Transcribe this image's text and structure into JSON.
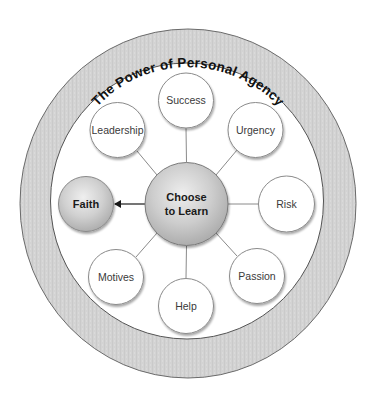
{
  "diagram": {
    "title": "The Power of Personal Agency",
    "center": {
      "line1": "Choose",
      "line2": "to Learn"
    },
    "outcome": {
      "label": "Faith"
    },
    "satellites": [
      {
        "label": "Success"
      },
      {
        "label": "Urgency"
      },
      {
        "label": "Risk"
      },
      {
        "label": "Passion"
      },
      {
        "label": "Help"
      },
      {
        "label": "Motives"
      },
      {
        "label": "Leadership"
      }
    ],
    "colors": {
      "ring_fill": "#d2d2d2",
      "ring_stroke": "#6a6a6a",
      "node_stroke": "#8a8a8a",
      "connector": "#8a8a8a",
      "arrow": "#1a1a1a"
    }
  }
}
